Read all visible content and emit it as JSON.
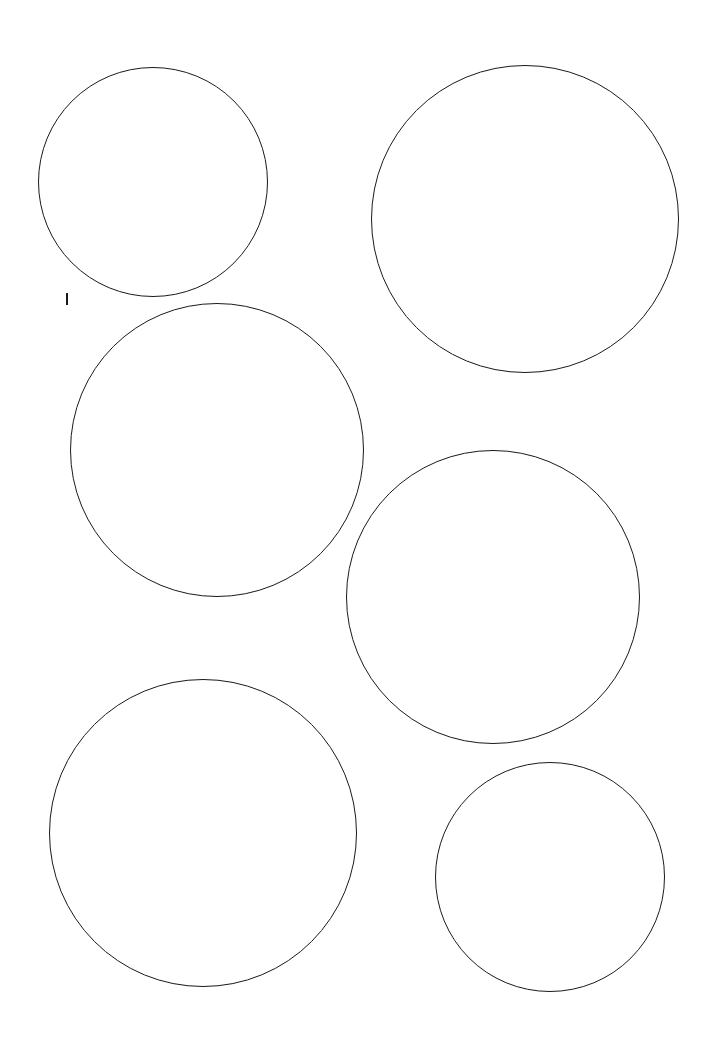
{
  "canvas": {
    "width": 716,
    "height": 1039,
    "background": "#ffffff",
    "stroke_color": "#1a1a1a"
  },
  "shapes": [
    {
      "type": "circle",
      "name": "circle-1",
      "cx": 153,
      "cy": 182,
      "r": 115
    },
    {
      "type": "circle",
      "name": "circle-2",
      "cx": 525,
      "cy": 219,
      "r": 154
    },
    {
      "type": "circle",
      "name": "circle-3",
      "cx": 217,
      "cy": 450,
      "r": 147
    },
    {
      "type": "circle",
      "name": "circle-4",
      "cx": 493,
      "cy": 597,
      "r": 147
    },
    {
      "type": "circle",
      "name": "circle-5",
      "cx": 203,
      "cy": 833,
      "r": 154
    },
    {
      "type": "circle",
      "name": "circle-6",
      "cx": 550,
      "cy": 877,
      "r": 115
    }
  ],
  "cursor": {
    "x": 66,
    "y": 293,
    "height": 12
  }
}
